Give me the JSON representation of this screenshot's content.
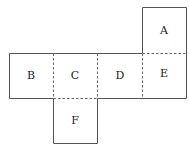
{
  "diagram": {
    "type": "cube-net",
    "faces": [
      {
        "label": "A",
        "col": 3,
        "row": 0
      },
      {
        "label": "B",
        "col": 0,
        "row": 1
      },
      {
        "label": "C",
        "col": 1,
        "row": 1
      },
      {
        "label": "D",
        "col": 2,
        "row": 1
      },
      {
        "label": "E",
        "col": 3,
        "row": 1
      },
      {
        "label": "F",
        "col": 1,
        "row": 2
      }
    ],
    "fold_lines": [
      "B|C",
      "C|D",
      "D|E",
      "A|E",
      "C|F"
    ],
    "colors": {
      "outline": "#555555",
      "fold": "#666666",
      "text": "#222222",
      "background": "#ffffff"
    }
  }
}
